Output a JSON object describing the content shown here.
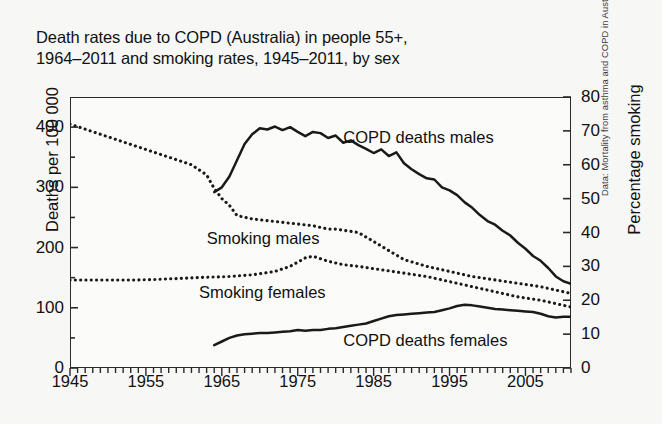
{
  "figure": {
    "title_line1": "Death rates due to COPD (Australia) in people 55+,",
    "title_line2": "1964–2011 and smoking rates, 1945–2011, by sex",
    "source_note": "Data: Mortality from asthma and COPD in Australia.",
    "background_color": "#f7f7f6",
    "line_color": "#1a1a1a"
  },
  "chart_data": {
    "type": "line",
    "title": "Death rates due to COPD (Australia) in people 55+, 1964–2011 and smoking rates, 1945–2011, by sex",
    "xlabel": "",
    "ylabel": "Deaths per 100 000",
    "y2label": "Percentage smoking",
    "xlim": [
      1945,
      2011
    ],
    "ylim": [
      0,
      450
    ],
    "y2lim": [
      0,
      80
    ],
    "grid": false,
    "legend": "inline-annotations",
    "xticks": [
      1945,
      1955,
      1965,
      1975,
      1985,
      1995,
      2005
    ],
    "xticklabels": [
      "1945",
      "1955",
      "1965",
      "1975",
      "1985",
      "1995",
      "2005"
    ],
    "xminor_tick_interval": 1,
    "yticks_left": [
      0,
      100,
      200,
      300,
      400
    ],
    "yticklabels_left": [
      "0",
      "100",
      "200",
      "300",
      "400"
    ],
    "yminor_tick_interval": 50,
    "yticks_right": [
      0,
      10,
      20,
      30,
      40,
      50,
      60,
      70,
      80
    ],
    "yticklabels_right": [
      "0",
      "10",
      "20",
      "30",
      "40",
      "50",
      "60",
      "70",
      "80"
    ],
    "series": [
      {
        "name": "COPD deaths males",
        "axis": "left",
        "style": "solid",
        "units": "deaths per 100 000",
        "x": [
          1964,
          1965,
          1966,
          1967,
          1968,
          1969,
          1970,
          1971,
          1972,
          1973,
          1974,
          1975,
          1976,
          1977,
          1978,
          1979,
          1980,
          1981,
          1982,
          1983,
          1984,
          1985,
          1986,
          1987,
          1988,
          1989,
          1990,
          1991,
          1992,
          1993,
          1994,
          1995,
          1996,
          1997,
          1998,
          1999,
          2000,
          2001,
          2002,
          2003,
          2004,
          2005,
          2006,
          2007,
          2008,
          2009,
          2010,
          2011
        ],
        "y": [
          292,
          300,
          318,
          345,
          372,
          388,
          398,
          396,
          401,
          395,
          400,
          392,
          385,
          392,
          390,
          382,
          386,
          374,
          378,
          370,
          364,
          357,
          363,
          352,
          358,
          340,
          330,
          322,
          315,
          313,
          300,
          295,
          287,
          275,
          266,
          254,
          244,
          238,
          228,
          220,
          208,
          198,
          186,
          178,
          166,
          152,
          144,
          140
        ]
      },
      {
        "name": "COPD deaths females",
        "axis": "left",
        "style": "solid",
        "units": "deaths per 100 000",
        "x": [
          1964,
          1965,
          1966,
          1967,
          1968,
          1969,
          1970,
          1971,
          1972,
          1973,
          1974,
          1975,
          1976,
          1977,
          1978,
          1979,
          1980,
          1981,
          1982,
          1983,
          1984,
          1985,
          1986,
          1987,
          1988,
          1989,
          1990,
          1991,
          1992,
          1993,
          1994,
          1995,
          1996,
          1997,
          1998,
          1999,
          2000,
          2001,
          2002,
          2003,
          2004,
          2005,
          2006,
          2007,
          2008,
          2009,
          2010,
          2011
        ],
        "y": [
          38,
          44,
          50,
          54,
          56,
          57,
          58,
          58,
          59,
          60,
          61,
          63,
          62,
          63,
          63,
          65,
          66,
          68,
          70,
          72,
          74,
          78,
          82,
          86,
          88,
          89,
          90,
          91,
          92,
          93,
          96,
          99,
          103,
          105,
          104,
          102,
          100,
          98,
          97,
          96,
          95,
          94,
          93,
          90,
          86,
          84,
          85,
          85
        ]
      },
      {
        "name": "Smoking males",
        "axis": "right",
        "style": "dotted",
        "units": "percentage smoking",
        "x": [
          1945,
          1947,
          1949,
          1951,
          1953,
          1955,
          1957,
          1959,
          1961,
          1963,
          1964,
          1965,
          1966,
          1967,
          1969,
          1971,
          1973,
          1975,
          1977,
          1979,
          1980,
          1983,
          1986,
          1989,
          1992,
          1995,
          1998,
          2001,
          2004,
          2007,
          2010,
          2011
        ],
        "y": [
          72,
          70.5,
          69,
          67.5,
          66,
          64.5,
          63,
          61.5,
          60,
          57,
          53,
          50,
          48,
          45,
          44,
          43.5,
          43,
          42.5,
          42,
          41,
          41,
          40,
          36,
          32,
          30,
          28.5,
          27,
          26,
          25,
          24,
          22.5,
          22
        ]
      },
      {
        "name": "Smoking females",
        "axis": "right",
        "style": "dotted",
        "units": "percentage smoking",
        "x": [
          1945,
          1948,
          1951,
          1954,
          1957,
          1960,
          1963,
          1966,
          1969,
          1972,
          1974,
          1976,
          1977,
          1979,
          1981,
          1983,
          1986,
          1989,
          1992,
          1995,
          1998,
          2001,
          2004,
          2007,
          2010,
          2011
        ],
        "y": [
          26,
          26,
          26,
          26,
          26.2,
          26.5,
          26.8,
          27,
          27.5,
          28.5,
          30,
          32.5,
          33,
          31.5,
          30.5,
          30,
          29,
          28,
          27,
          25.5,
          24,
          22.5,
          21,
          20,
          18.5,
          18
        ]
      }
    ],
    "annotations": [
      {
        "text": "COPD deaths males",
        "x": 1981,
        "y_right": 68
      },
      {
        "text": "Smoking males",
        "x": 1963,
        "y_right": 38
      },
      {
        "text": "Smoking females",
        "x": 1962,
        "y_right": 22
      },
      {
        "text": "COPD deaths females",
        "x": 1981,
        "y_right": 8
      }
    ]
  },
  "axes": {
    "left_title": "Deaths per 100 000",
    "right_title": "Percentage smoking"
  }
}
